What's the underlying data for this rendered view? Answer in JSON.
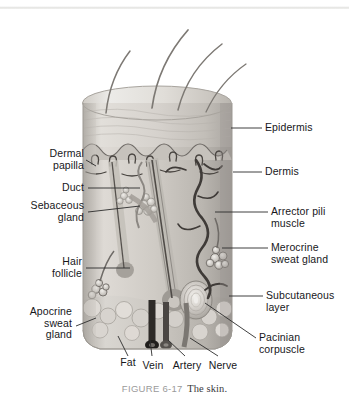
{
  "figure": {
    "caption_number": "FIGURE 6-17",
    "caption_text": "The skin.",
    "style": "grayscale anatomical illustration"
  },
  "colors": {
    "background": "#ffffff",
    "label_text": "#17171b",
    "caption_number": "#9a9a9a",
    "caption_text": "#3b3b3b",
    "leader_line": "#2b2b2b",
    "skin_light": "#e7e4e0",
    "skin_mid": "#c9c5c0",
    "skin_dark": "#9b9690",
    "hair_dark": "#55514d"
  },
  "labels": {
    "right": [
      {
        "id": "epidermis",
        "text": "Epidermis"
      },
      {
        "id": "dermis",
        "text": "Dermis"
      },
      {
        "id": "arrector-pili-muscle",
        "text": "Arrector pili\nmuscle"
      },
      {
        "id": "merocrine-sweat-gland",
        "text": "Merocrine\nsweat gland"
      },
      {
        "id": "subcutaneous-layer",
        "text": "Subcutaneous\nlayer"
      },
      {
        "id": "pacinian-corpuscle",
        "text": "Pacinian\ncorpuscle"
      }
    ],
    "left": [
      {
        "id": "dermal-papilla",
        "text": "Dermal\npapilla"
      },
      {
        "id": "duct",
        "text": "Duct"
      },
      {
        "id": "sebaceous-gland",
        "text": "Sebaceous\ngland"
      },
      {
        "id": "hair-follicle",
        "text": "Hair\nfollicle"
      },
      {
        "id": "apocrine-sweat-gland",
        "text": "Apocrine\nsweat\ngland"
      }
    ],
    "bottom": [
      {
        "id": "fat",
        "text": "Fat"
      },
      {
        "id": "vein",
        "text": "Vein"
      },
      {
        "id": "artery",
        "text": "Artery"
      },
      {
        "id": "nerve",
        "text": "Nerve"
      }
    ]
  }
}
